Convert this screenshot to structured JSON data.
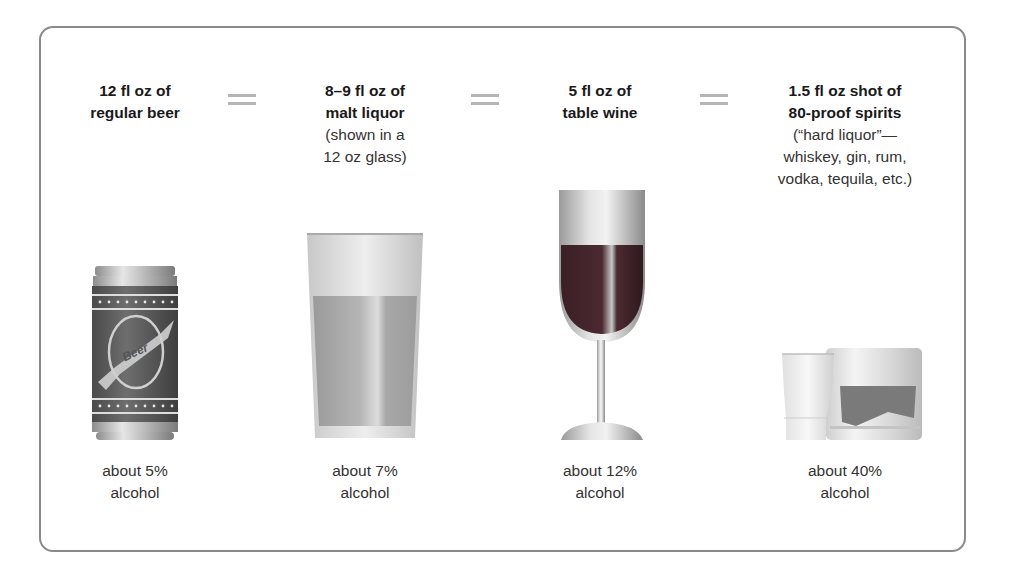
{
  "drinks": [
    {
      "id": "beer",
      "title_lines": [
        "12 fl oz of",
        "regular beer"
      ],
      "sub_lines": [],
      "pct_lines": [
        "about 5%",
        "alcohol"
      ],
      "illustration": "beer-can-icon",
      "can_label": "Beer"
    },
    {
      "id": "malt-liquor",
      "title_lines": [
        "8–9 fl oz of",
        "malt liquor"
      ],
      "sub_lines": [
        "(shown in a",
        "12 oz glass)"
      ],
      "pct_lines": [
        "about 7%",
        "alcohol"
      ],
      "illustration": "pint-glass-icon"
    },
    {
      "id": "wine",
      "title_lines": [
        "5 fl oz of",
        "table wine"
      ],
      "sub_lines": [],
      "pct_lines": [
        "about 12%",
        "alcohol"
      ],
      "illustration": "wine-glass-icon"
    },
    {
      "id": "spirits",
      "title_lines": [
        "1.5 fl oz shot of",
        "80-proof spirits"
      ],
      "sub_lines": [
        "(“hard liquor”—",
        "whiskey, gin, rum,",
        "vodka, tequila, etc.)"
      ],
      "pct_lines": [
        "about 40%",
        "alcohol"
      ],
      "illustration": "shot-and-rocks-glass-icon"
    }
  ],
  "separator_symbol": "="
}
